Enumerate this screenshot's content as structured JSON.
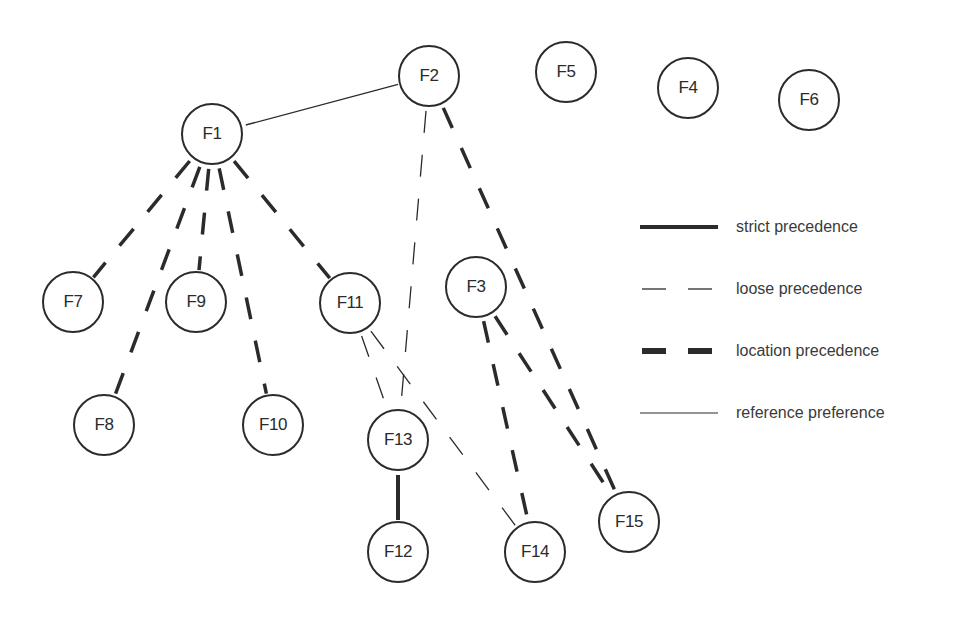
{
  "diagram": {
    "type": "precedence-graph",
    "colors": {
      "line": "#2b2b2b",
      "text": "#2b2b2b",
      "background": "#ffffff"
    },
    "nodes": [
      {
        "id": "F1",
        "label": "F1",
        "x": 212,
        "y": 134
      },
      {
        "id": "F2",
        "label": "F2",
        "x": 429,
        "y": 76
      },
      {
        "id": "F3",
        "label": "F3",
        "x": 476,
        "y": 287
      },
      {
        "id": "F4",
        "label": "F4",
        "x": 688,
        "y": 88
      },
      {
        "id": "F5",
        "label": "F5",
        "x": 566,
        "y": 72
      },
      {
        "id": "F6",
        "label": "F6",
        "x": 809,
        "y": 100
      },
      {
        "id": "F7",
        "label": "F7",
        "x": 73,
        "y": 302
      },
      {
        "id": "F8",
        "label": "F8",
        "x": 104,
        "y": 425
      },
      {
        "id": "F9",
        "label": "F9",
        "x": 196,
        "y": 302
      },
      {
        "id": "F10",
        "label": "F10",
        "x": 273,
        "y": 425
      },
      {
        "id": "F11",
        "label": "F11",
        "x": 350,
        "y": 303
      },
      {
        "id": "F12",
        "label": "F12",
        "x": 398,
        "y": 552
      },
      {
        "id": "F13",
        "label": "F13",
        "x": 398,
        "y": 440
      },
      {
        "id": "F14",
        "label": "F14",
        "x": 535,
        "y": 552
      },
      {
        "id": "F15",
        "label": "F15",
        "x": 629,
        "y": 522
      }
    ],
    "edges": [
      {
        "from": "F1",
        "to": "F2",
        "kind": "reference"
      },
      {
        "from": "F1",
        "to": "F7",
        "kind": "location"
      },
      {
        "from": "F1",
        "to": "F8",
        "kind": "location"
      },
      {
        "from": "F1",
        "to": "F9",
        "kind": "location"
      },
      {
        "from": "F1",
        "to": "F10",
        "kind": "location"
      },
      {
        "from": "F1",
        "to": "F11",
        "kind": "location"
      },
      {
        "from": "F2",
        "to": "F13",
        "kind": "loose"
      },
      {
        "from": "F2",
        "to": "F15",
        "kind": "location"
      },
      {
        "from": "F11",
        "to": "F13",
        "kind": "loose"
      },
      {
        "from": "F11",
        "to": "F14",
        "kind": "loose"
      },
      {
        "from": "F3",
        "to": "F14",
        "kind": "location"
      },
      {
        "from": "F3",
        "to": "F15",
        "kind": "location"
      },
      {
        "from": "F13",
        "to": "F12",
        "kind": "strict"
      }
    ],
    "edge_styles": {
      "strict": {
        "width": 4,
        "dash": ""
      },
      "loose": {
        "width": 1.3,
        "dash": "22 22"
      },
      "location": {
        "width": 3.5,
        "dash": "22 22"
      },
      "reference": {
        "width": 1.3,
        "dash": ""
      }
    }
  },
  "legend": {
    "items": [
      {
        "kind": "strict",
        "label": "strict precedence",
        "y": 227
      },
      {
        "kind": "loose",
        "label": "loose precedence",
        "y": 289
      },
      {
        "kind": "location",
        "label": "location precedence",
        "y": 351
      },
      {
        "kind": "reference",
        "label": "reference preference",
        "y": 413
      }
    ]
  }
}
